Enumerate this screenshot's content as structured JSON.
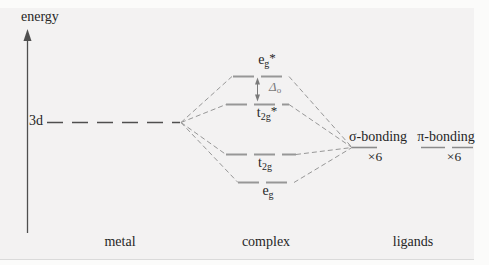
{
  "colors": {
    "page_bg": "#fbfbfa",
    "figure_bg": "#f3f2f2",
    "ink": "#262626",
    "line_dark": "#4f4f4f",
    "line_gray": "#979797",
    "line_mid": "#8a8a8a",
    "delta": "#7a7a7a"
  },
  "axis": {
    "label": "energy"
  },
  "metal": {
    "column_label": "metal",
    "level_label": "3d"
  },
  "complex": {
    "column_label": "complex",
    "levels": {
      "eg_star": {
        "base": "e",
        "sub": "g",
        "sup": "*"
      },
      "t2g_star": {
        "base": "t",
        "sub": "2g",
        "sup": "*"
      },
      "t2g": {
        "base": "t",
        "sub": "2g",
        "sup": ""
      },
      "eg": {
        "base": "e",
        "sub": "g",
        "sup": ""
      }
    },
    "splitting": {
      "base": "Δ",
      "sub": "o"
    }
  },
  "ligands": {
    "column_label": "ligands",
    "sigma": {
      "label": "σ-bonding",
      "count": "×6"
    },
    "pi": {
      "label": "π-bonding",
      "count": "×6"
    }
  }
}
